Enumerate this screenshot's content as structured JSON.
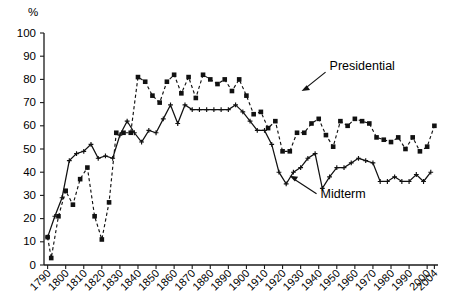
{
  "chart_data": {
    "type": "line",
    "title": "",
    "xlabel": "",
    "ylabel": "%",
    "ylim": [
      0,
      100
    ],
    "xlim": [
      1788,
      2006
    ],
    "grid": false,
    "legend_position": "inline-annotations",
    "ytick_labels": [
      "0",
      "10",
      "20",
      "30",
      "40",
      "50",
      "60",
      "70",
      "80",
      "90",
      "100"
    ],
    "ytick_values": [
      0,
      10,
      20,
      30,
      40,
      50,
      60,
      70,
      80,
      90,
      100
    ],
    "xtick_labels": [
      "1790",
      "1800",
      "1810",
      "1820",
      "1830",
      "1840",
      "1850",
      "1860",
      "1870",
      "1880",
      "1890",
      "1900",
      "1910",
      "1920",
      "1930",
      "1940",
      "1950",
      "1960",
      "1970",
      "1980",
      "1990",
      "2000",
      "2004"
    ],
    "xtick_values": [
      1790,
      1800,
      1810,
      1820,
      1830,
      1840,
      1850,
      1860,
      1870,
      1880,
      1890,
      1900,
      1910,
      1920,
      1930,
      1940,
      1950,
      1960,
      1970,
      1980,
      1990,
      2000,
      2004
    ],
    "annotations": [
      {
        "text": "Presidential",
        "x": 1946,
        "y": 84
      },
      {
        "text": "Midterm",
        "x": 1941,
        "y": 29
      }
    ],
    "series": [
      {
        "name": "Presidential",
        "style": "dashed",
        "marker": "square",
        "x": [
          1790,
          1792,
          1796,
          1800,
          1804,
          1808,
          1812,
          1816,
          1820,
          1824,
          1828,
          1832,
          1836,
          1840,
          1844,
          1848,
          1852,
          1856,
          1860,
          1864,
          1868,
          1872,
          1876,
          1880,
          1884,
          1888,
          1892,
          1896,
          1900,
          1904,
          1908,
          1912,
          1916,
          1920,
          1924,
          1928,
          1932,
          1936,
          1940,
          1944,
          1948,
          1952,
          1956,
          1960,
          1964,
          1968,
          1972,
          1976,
          1980,
          1984,
          1988,
          1992,
          1996,
          2000,
          2004
        ],
        "values": [
          12,
          3,
          21,
          32,
          26,
          37,
          42,
          21,
          11,
          27,
          57,
          57,
          57,
          81,
          79,
          73,
          70,
          79,
          82,
          74,
          81,
          72,
          82,
          80,
          78,
          80,
          75,
          80,
          73,
          65,
          66,
          59,
          62,
          49,
          49,
          57,
          57,
          61,
          63,
          56,
          51,
          62,
          60,
          63,
          62,
          61,
          55,
          54,
          53,
          55,
          50,
          55,
          49,
          51,
          60
        ]
      },
      {
        "name": "Midterm",
        "style": "solid",
        "marker": "plus",
        "x": [
          1790,
          1794,
          1798,
          1802,
          1806,
          1810,
          1814,
          1818,
          1822,
          1826,
          1830,
          1834,
          1838,
          1842,
          1846,
          1850,
          1854,
          1858,
          1862,
          1866,
          1870,
          1874,
          1878,
          1882,
          1886,
          1890,
          1894,
          1898,
          1902,
          1906,
          1910,
          1914,
          1918,
          1922,
          1926,
          1930,
          1934,
          1938,
          1942,
          1946,
          1950,
          1954,
          1958,
          1962,
          1966,
          1970,
          1974,
          1978,
          1982,
          1986,
          1990,
          1994,
          1998,
          2002
        ],
        "values": [
          12,
          21,
          29,
          45,
          48,
          49,
          52,
          46,
          47,
          46,
          56,
          62,
          57,
          53,
          58,
          57,
          63,
          69,
          61,
          69,
          67,
          67,
          67,
          67,
          67,
          67,
          69,
          66,
          62,
          58,
          58,
          52,
          40,
          35,
          40,
          42,
          46,
          48,
          33,
          38,
          42,
          42,
          44,
          46,
          45,
          44,
          36,
          36,
          38,
          36,
          36,
          39,
          36,
          40
        ]
      }
    ]
  }
}
